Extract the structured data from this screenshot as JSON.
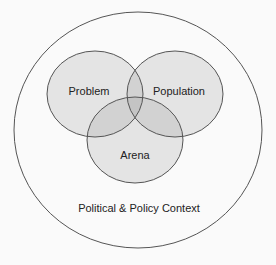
{
  "diagram": {
    "type": "venn",
    "outer": {
      "label": "Political & Policy Context"
    },
    "sets": [
      {
        "label": "Problem"
      },
      {
        "label": "Population"
      },
      {
        "label": "Arena"
      }
    ]
  },
  "colors": {
    "background": "#fafafa",
    "stroke": "#555555",
    "set_fill": "#e4e4e4",
    "overlap_fill": "#d2d2d2",
    "triple_overlap_fill": "#c4c4c4",
    "text": "#222222"
  }
}
